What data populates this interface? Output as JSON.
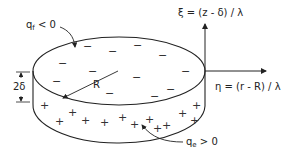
{
  "diagram": {
    "labels": {
      "top_charge": {
        "symbol": "q",
        "subscript": "f",
        "relation": "< 0"
      },
      "side_charge": {
        "symbol": "q",
        "subscript": "e",
        "relation": "> 0"
      },
      "radius": "R",
      "thickness": "2δ",
      "xi_axis": "ξ = (z - δ) / λ",
      "eta_axis": "η = (r - R) / λ"
    },
    "charge_signs": {
      "negative": "−",
      "positive": "+"
    },
    "colors": {
      "line": "#222222",
      "background": "#ffffff"
    }
  }
}
